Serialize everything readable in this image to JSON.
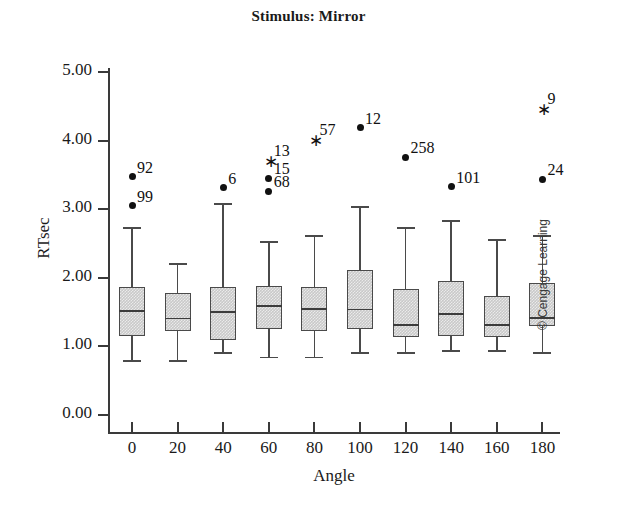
{
  "chart_data": {
    "type": "box",
    "title": "Stimulus: Mirror",
    "xlabel": "Angle",
    "ylabel": "RTsec",
    "ylim": [
      0.0,
      5.0
    ],
    "yticks": [
      "0.00",
      "1.00",
      "2.00",
      "3.00",
      "4.00",
      "5.00"
    ],
    "ytick_values": [
      0,
      1,
      2,
      3,
      4,
      5
    ],
    "categories": [
      "0",
      "20",
      "40",
      "60",
      "80",
      "100",
      "120",
      "140",
      "160",
      "180"
    ],
    "grid": false,
    "legend": false,
    "boxes": [
      {
        "category": "0",
        "whisker_low": 0.8,
        "q1": 1.15,
        "median": 1.53,
        "q3": 1.86,
        "whisker_high": 2.74
      },
      {
        "category": "20",
        "whisker_low": 0.8,
        "q1": 1.22,
        "median": 1.42,
        "q3": 1.78,
        "whisker_high": 2.21
      },
      {
        "category": "40",
        "whisker_low": 0.92,
        "q1": 1.1,
        "median": 1.52,
        "q3": 1.87,
        "whisker_high": 3.09
      },
      {
        "category": "60",
        "whisker_low": 0.85,
        "q1": 1.25,
        "median": 1.6,
        "q3": 1.88,
        "whisker_high": 2.53
      },
      {
        "category": "80",
        "whisker_low": 0.85,
        "q1": 1.22,
        "median": 1.56,
        "q3": 1.86,
        "whisker_high": 2.62
      },
      {
        "category": "100",
        "whisker_low": 0.92,
        "q1": 1.25,
        "median": 1.55,
        "q3": 2.12,
        "whisker_high": 3.05
      },
      {
        "category": "120",
        "whisker_low": 0.92,
        "q1": 1.13,
        "median": 1.33,
        "q3": 1.83,
        "whisker_high": 2.74
      },
      {
        "category": "140",
        "whisker_low": 0.95,
        "q1": 1.15,
        "median": 1.49,
        "q3": 1.95,
        "whisker_high": 2.84
      },
      {
        "category": "160",
        "whisker_low": 0.95,
        "q1": 1.14,
        "median": 1.32,
        "q3": 1.74,
        "whisker_high": 2.56
      },
      {
        "category": "180",
        "whisker_low": 0.92,
        "q1": 1.3,
        "median": 1.43,
        "q3": 1.93,
        "whisker_high": 2.62
      }
    ],
    "outliers": [
      {
        "category": "0",
        "value": 3.47,
        "label": "92",
        "marker": "dot"
      },
      {
        "category": "0",
        "value": 3.05,
        "label": "99",
        "marker": "dot"
      },
      {
        "category": "40",
        "value": 3.31,
        "label": "6",
        "marker": "dot"
      },
      {
        "category": "60",
        "value": 3.72,
        "label": "13",
        "marker": "star"
      },
      {
        "category": "60",
        "value": 3.45,
        "label": "15",
        "marker": "dot"
      },
      {
        "category": "60",
        "value": 3.26,
        "label": "68",
        "marker": "dot"
      },
      {
        "category": "80",
        "value": 4.02,
        "label": "57",
        "marker": "star"
      },
      {
        "category": "100",
        "value": 4.19,
        "label": "12",
        "marker": "dot"
      },
      {
        "category": "120",
        "value": 3.76,
        "label": "258",
        "marker": "dot"
      },
      {
        "category": "140",
        "value": 3.33,
        "label": "101",
        "marker": "dot"
      },
      {
        "category": "180",
        "value": 4.48,
        "label": "9",
        "marker": "star"
      },
      {
        "category": "180",
        "value": 3.44,
        "label": "24",
        "marker": "dot"
      }
    ],
    "colors": {
      "box_fill": "#c9c9c9",
      "box_border": "#4a4a4a",
      "median_line": "#3c3c3c",
      "outlier": "#111111",
      "axis": "#3a3a3a"
    }
  },
  "footer": {
    "copyright": "© Cengage Learning"
  }
}
